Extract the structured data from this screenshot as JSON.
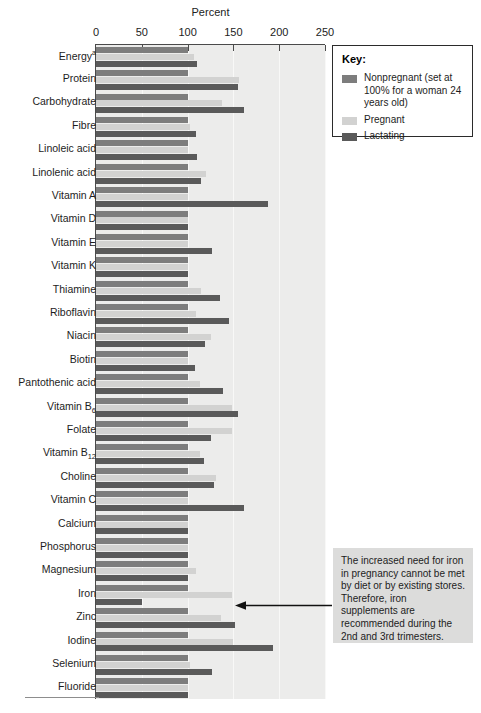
{
  "chart_data": {
    "type": "bar",
    "title": "",
    "xlabel": "Percent",
    "ylabel": "",
    "orientation": "horizontal",
    "xlim": [
      0,
      250
    ],
    "xticks": [
      0,
      50,
      100,
      150,
      200,
      250
    ],
    "grid": true,
    "legend_position": "top-right",
    "series": [
      {
        "name": "Nonpregnant",
        "color": "#7d7d7d",
        "values": [
          100,
          100,
          100,
          100,
          100,
          100,
          100,
          100,
          100,
          100,
          100,
          100,
          100,
          100,
          100,
          100,
          100,
          100,
          100,
          100,
          100,
          100,
          100,
          100,
          100,
          100,
          100,
          100
        ]
      },
      {
        "name": "Pregnant",
        "color": "#d2d2d1",
        "values": [
          107,
          156,
          138,
          103,
          100,
          120,
          100,
          100,
          100,
          100,
          115,
          109,
          126,
          100,
          113,
          149,
          148,
          113,
          131,
          100,
          100,
          100,
          109,
          148,
          136,
          150,
          103,
          100
        ]
      },
      {
        "name": "Lactating",
        "color": "#5a5a5a",
        "values": [
          110,
          155,
          162,
          109,
          110,
          115,
          188,
          100,
          127,
          100,
          135,
          145,
          119,
          108,
          139,
          155,
          125,
          118,
          129,
          162,
          100,
          100,
          100,
          50,
          152,
          193,
          127,
          100
        ]
      }
    ],
    "categories": [
      "Energy",
      "Protein",
      "Carbohydrate",
      "Fibre",
      "Linoleic acid",
      "Linolenic acid",
      "Vitamin A",
      "Vitamin D",
      "Vitamin E",
      "Vitamin K",
      "Thiamine",
      "Riboflavin",
      "Niacin",
      "Biotin",
      "Pantothenic acid",
      "Vitamin B6",
      "Folate",
      "Vitamin B12",
      "Choline",
      "Vitamin C",
      "Calcium",
      "Phosphorus",
      "Magnesium",
      "Iron",
      "Zinc",
      "Iodine",
      "Selenium",
      "Fluoride"
    ],
    "category_labels_html": [
      "Energy<sup>a</sup>",
      "Protein",
      "Carbohydrate",
      "Fibre",
      "Linoleic acid",
      "Linolenic acid",
      "Vitamin A",
      "Vitamin D",
      "Vitamin E",
      "Vitamin K",
      "Thiamine",
      "Riboflavin",
      "Niacin",
      "Biotin",
      "Pantothenic acid",
      "Vitamin B<sub>6</sub>",
      "Folate",
      "Vitamin B<sub>12</sub>",
      "Choline",
      "Vitamin C",
      "Calcium",
      "Phosphorus",
      "Magnesium",
      "Iron",
      "Zinc",
      "Iodine",
      "Selenium",
      "Fluoride"
    ],
    "annotations": [
      {
        "text": "The increased need for iron in pregnancy cannot be met by diet or by existing stores. Therefore, iron supplements are recommended during the 2nd and 3rd trimesters.",
        "points_to": "Iron"
      }
    ]
  },
  "axis": {
    "title": "Percent",
    "tick_labels": [
      "0",
      "50",
      "100",
      "150",
      "200",
      "250"
    ]
  },
  "key": {
    "title": "Key:",
    "items": [
      {
        "label": "Nonpregnant (set at 100% for a woman 24 years old)",
        "color": "#7d7d7d"
      },
      {
        "label": "Pregnant",
        "color": "#d2d2d1"
      },
      {
        "label": "Lactating",
        "color": "#5a5a5a"
      }
    ]
  },
  "annotation": {
    "text": "The increased need for iron in pregnancy cannot be met by diet or by existing stores. Therefore, iron supplements are recommended during the 2nd and 3rd trimesters."
  },
  "colors": {
    "plot_background": "#ececeb",
    "gridline": "#f8f8f7",
    "axis": "#4a4a4a",
    "annotation_background": "#dcdcdb"
  }
}
